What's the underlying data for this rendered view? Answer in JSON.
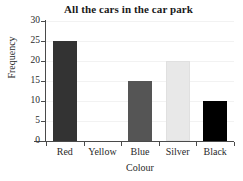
{
  "chart_data": {
    "type": "bar",
    "title": "All the cars in the car park",
    "xlabel": "Colour",
    "ylabel": "Frequency",
    "categories": [
      "Red",
      "Yellow",
      "Blue",
      "Silver",
      "Black"
    ],
    "values": [
      25,
      0,
      15,
      20,
      10
    ],
    "bar_colors": [
      "#333333",
      "#ffffff",
      "#555555",
      "#e8e8e8",
      "#000000"
    ],
    "bar_edge_colors": [
      "#333333",
      "#ffffff",
      "#555555",
      "#e0e0e0",
      "#000000"
    ],
    "ylim": [
      0,
      30
    ],
    "ytick_labels": [
      "0",
      "5",
      "10",
      "15",
      "20",
      "25",
      "30"
    ],
    "ytick_values": [
      0,
      5,
      10,
      15,
      20,
      25,
      30
    ],
    "grid": "faint-horizontal",
    "legend": "none"
  }
}
